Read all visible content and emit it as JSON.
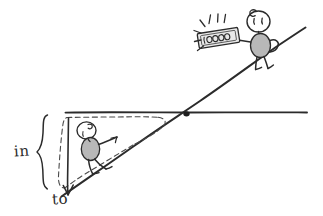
{
  "figure": {
    "type": "hand-drawn-diagram"
  },
  "labels": {
    "in": "in",
    "to": "to"
  },
  "banknote": {
    "value": "10000"
  },
  "icons": {
    "upper_person": "stick-figure-icon",
    "lower_person": "stick-figure-icon",
    "money": "banknote-icon",
    "sparkle": "sparkle-lines-icon",
    "arrow_down": "down-arrow-icon",
    "brace": "curly-brace-icon",
    "intersection": "intersection-dot-icon"
  },
  "colors": {
    "ink": "#2b2b2b",
    "body_fill": "#b8b8b8",
    "note_fill": "#e8e8e8",
    "background": "#ffffff",
    "dash": "#4a4a4a"
  },
  "geometry": {
    "horizontal_line": "y=112 from x=65 to x=307",
    "diagonal_line": "from (62,196) to (305,28)",
    "intersection_point": "(186,114)"
  }
}
